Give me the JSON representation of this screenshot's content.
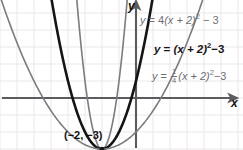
{
  "chart_data": {
    "type": "line",
    "title": "",
    "xlabel": "x",
    "ylabel": "y",
    "grid": true,
    "legend": "inline-curve-labels",
    "xlim": [
      -7.5,
      6.0
    ],
    "ylim": [
      -4.0,
      5.5
    ],
    "origin_label": "O",
    "vertex": {
      "x": -2,
      "y": -3,
      "label": "(−2, −3)"
    },
    "series": [
      {
        "name": "y = 4(x + 2)² − 3",
        "equation_parts": {
          "lhs": "y",
          "eq": "=",
          "coef": "4",
          "body": "(x + 2)",
          "power": "2",
          "const": "− 3"
        },
        "a": 4,
        "h": -2,
        "k": -3,
        "color": "#7b7b80",
        "width": 1.6,
        "emphasis": "normal",
        "label_clipped": true
      },
      {
        "name": "y = (x + 2)² − 3",
        "equation_parts": {
          "lhs": "y",
          "eq": "=",
          "coef": "",
          "body": "(x + 2)",
          "power": "2",
          "const": "− 3"
        },
        "a": 1,
        "h": -2,
        "k": -3,
        "color": "#141414",
        "width": 2.6,
        "emphasis": "bold",
        "label_clipped": false
      },
      {
        "name": "y = ¼(x + 2)² − 3",
        "equation_parts": {
          "lhs": "y",
          "eq": "=",
          "coef_num": "1",
          "coef_den": "4",
          "body": "(x + 2)",
          "power": "2",
          "const": "−3"
        },
        "a": 0.25,
        "h": -2,
        "k": -3,
        "color": "#7b7b80",
        "width": 1.6,
        "emphasis": "normal",
        "label_clipped": false
      }
    ]
  },
  "labels": {
    "eq_a_lhs": "y",
    "eq_a_eq": "=",
    "eq_a_coef": "4",
    "eq_a_body": "(x + 2)",
    "eq_a_pow": "2",
    "eq_a_const": "− 3",
    "eq_b_lhs": "y",
    "eq_b_eq": "=",
    "eq_b_body": "(x + 2)",
    "eq_b_pow": "2",
    "eq_b_const": "−3",
    "eq_c_lhs": "y",
    "eq_c_eq": "=",
    "eq_c_num": "1",
    "eq_c_den": "4",
    "eq_c_body": "(x + 2)",
    "eq_c_pow": "2",
    "eq_c_const": "−3",
    "axis_y": "y",
    "axis_x": "x",
    "origin": "O",
    "vertex": "(−2, −3)"
  },
  "colors": {
    "background": "#ffffff",
    "grid": "#ece7ea",
    "axis": "#5b5b60",
    "curve_bold": "#141414",
    "curve_grey": "#7b7b80",
    "text": "#111111",
    "text_grey": "#6e6e73"
  }
}
